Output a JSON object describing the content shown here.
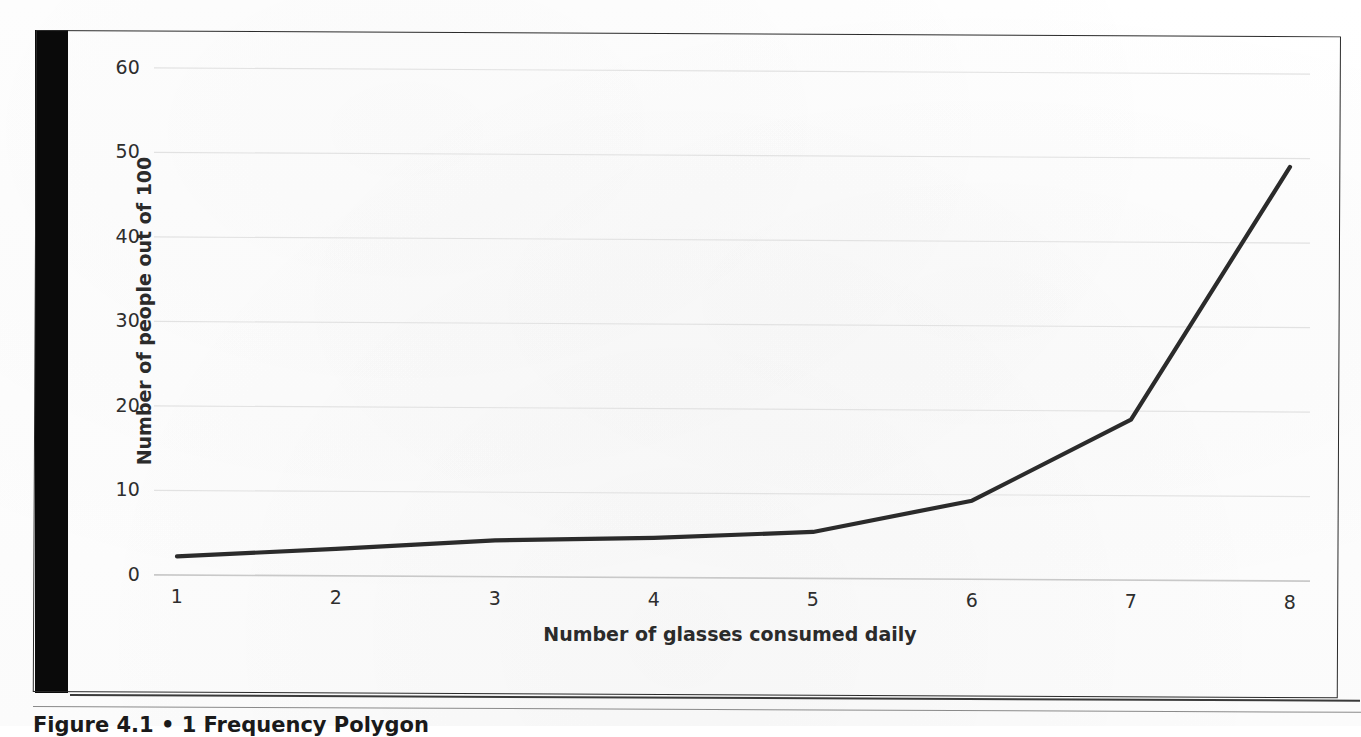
{
  "figure": {
    "caption": "Figure 4.1  •  1 Frequency Polygon",
    "gutter_artifact": "black-scan-bar"
  },
  "chart_data": {
    "type": "line",
    "title": "",
    "subtitle": "",
    "xlabel": "Number of glasses consumed daily",
    "ylabel": "Number of people out of 100",
    "x": [
      1,
      2,
      3,
      4,
      5,
      6,
      7,
      8
    ],
    "categories": [
      "1",
      "2",
      "3",
      "4",
      "5",
      "6",
      "7",
      "8"
    ],
    "series": [
      {
        "name": "People",
        "values": [
          2.2,
          3.2,
          4.3,
          4.7,
          5.5,
          9.3,
          19,
          49
        ]
      }
    ],
    "xlim": [
      1,
      8
    ],
    "ylim": [
      0,
      60
    ],
    "ytick_labels": [
      "60",
      "50",
      "40",
      "30",
      "20",
      "10",
      "0"
    ],
    "ytick_values": [
      60,
      50,
      40,
      30,
      20,
      10,
      0
    ],
    "xtick_labels": [
      "1",
      "2",
      "3",
      "4",
      "5",
      "6",
      "7",
      "8"
    ],
    "grid": "horizontal",
    "legend": "none",
    "line_color": "#2b2b2b",
    "grid_color": "#e2e2e2",
    "axis_color": "#c9c9c9",
    "background_color": "#ffffff"
  }
}
